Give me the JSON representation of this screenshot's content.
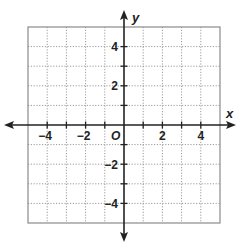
{
  "chart_data": {
    "type": "scatter",
    "title": "",
    "xlabel": "x",
    "ylabel": "y",
    "origin_label": "O",
    "xlim": [
      -5,
      5
    ],
    "ylim": [
      -5,
      5
    ],
    "grid": true,
    "grid_style": "dotted",
    "x_ticks": [
      -5,
      -4,
      -3,
      -2,
      -1,
      0,
      1,
      2,
      3,
      4,
      5
    ],
    "y_ticks": [
      -5,
      -4,
      -3,
      -2,
      -1,
      0,
      1,
      2,
      3,
      4,
      5
    ],
    "x_tick_labels": [
      {
        "value": -4,
        "text": "−4"
      },
      {
        "value": -2,
        "text": "−2"
      },
      {
        "value": 2,
        "text": "2"
      },
      {
        "value": 4,
        "text": "4"
      }
    ],
    "y_tick_labels": [
      {
        "value": 4,
        "text": "4"
      },
      {
        "value": 2,
        "text": "2"
      },
      {
        "value": -2,
        "text": "−2"
      },
      {
        "value": -4,
        "text": "−4"
      }
    ],
    "series": [],
    "legend": null
  },
  "colors": {
    "axis": "#222222",
    "grid": "#9a9a9a",
    "border": "#8a8a8a",
    "background": "#ffffff"
  }
}
